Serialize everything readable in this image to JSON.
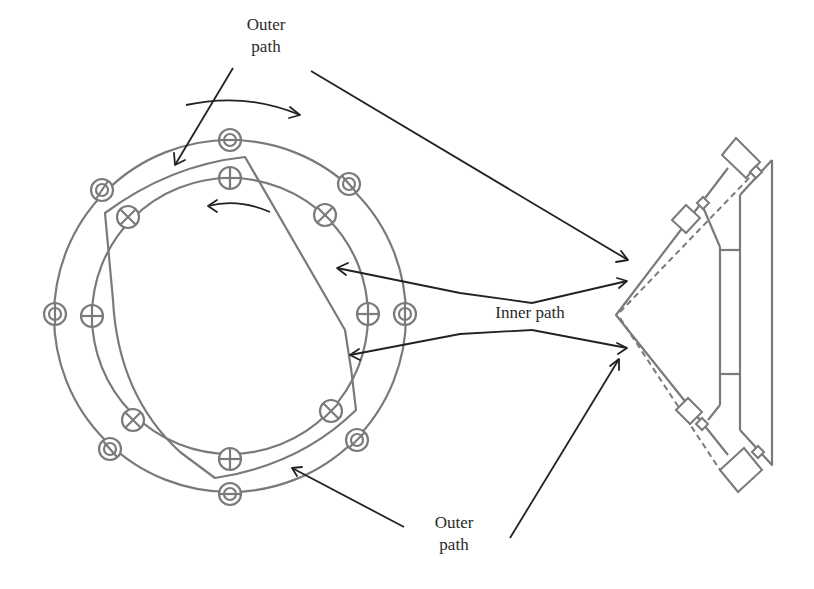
{
  "diagram": {
    "title": "",
    "labels": {
      "outer_path_top": [
        "Outer",
        "path"
      ],
      "inner_path": "Inner path",
      "outer_path_bottom": [
        "Outer",
        "path"
      ]
    },
    "colors": {
      "line_gray": "#7a7a7a",
      "arrow_black": "#222222",
      "text": "#2a2a2a",
      "background": "#ffffff"
    },
    "components": {
      "outer_ring": {
        "center": [
          230,
          315
        ],
        "radius": 175
      },
      "inner_ring": {
        "center": [
          230,
          315
        ],
        "radius": 138
      },
      "outer_ring_markers": {
        "count": 8,
        "style": "double-circle-slash"
      },
      "inner_ring_markers": {
        "count": 8,
        "style": "circle-plus-or-cross"
      },
      "rotation_arrows": [
        {
          "direction": "clockwise",
          "position": "top-outer"
        },
        {
          "direction": "counterclockwise",
          "position": "top-inner"
        }
      ],
      "right_assembly": "V-shaped bracket with rollers and dashed inner path"
    }
  }
}
